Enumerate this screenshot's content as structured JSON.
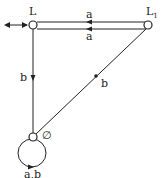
{
  "diagram": {
    "type": "state-transition-automaton",
    "colors": {
      "stroke": "#222222",
      "background": "#ffffff"
    },
    "states": [
      {
        "id": "L",
        "label": "L",
        "initial": true
      },
      {
        "id": "L1",
        "label": "L",
        "subscript": "1"
      },
      {
        "id": "empty",
        "label": "∅"
      }
    ],
    "edges": [
      {
        "from": "L1",
        "to": "L",
        "label": "a"
      },
      {
        "from": "L",
        "to": "L1",
        "label": "a"
      },
      {
        "from": "L",
        "to": "empty",
        "label": "b"
      },
      {
        "from": "L1",
        "to": "empty",
        "label": "b"
      },
      {
        "from": "empty",
        "to": "empty",
        "label": "a,b"
      }
    ]
  }
}
